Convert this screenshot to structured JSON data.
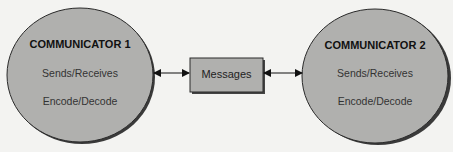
{
  "diagram": {
    "communicator_1": {
      "title": "COMMUNICATOR 1",
      "lines": [
        "Sends/Receives",
        "Encode/Decode"
      ]
    },
    "communicator_2": {
      "title": "COMMUNICATOR 2",
      "lines": [
        "Sends/Receives",
        "Encode/Decode"
      ]
    },
    "channel": {
      "label": "Messages"
    },
    "connectors": [
      {
        "from": "communicator_1",
        "to": "channel",
        "type": "bidirectional-arrow"
      },
      {
        "from": "channel",
        "to": "communicator_2",
        "type": "bidirectional-arrow"
      }
    ],
    "colors": {
      "node_fill": "#b0b0ae",
      "node_stroke": "#2a2a2a",
      "shadow": "#555555",
      "background": "#f3f3f1"
    }
  }
}
